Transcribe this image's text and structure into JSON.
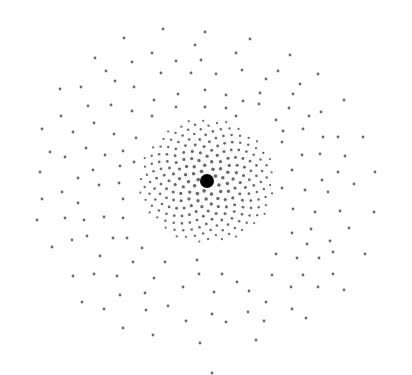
{
  "image": {
    "description": "Hand-drawn radial dot pattern with a large black central dot and gray dots becoming sparser outward",
    "width": 412,
    "height": 375,
    "background": "#ffffff",
    "dot_color": "#6a6a6a",
    "center_color": "#000000",
    "center": {
      "x": 207,
      "y": 181,
      "r": 7
    },
    "outer_dots": [
      [
        163,
        29
      ],
      [
        205,
        32
      ],
      [
        250,
        39
      ],
      [
        124,
        38
      ],
      [
        195,
        45
      ],
      [
        152,
        53
      ],
      [
        236,
        53
      ],
      [
        290,
        55
      ],
      [
        95,
        58
      ],
      [
        132,
        62
      ],
      [
        176,
        61
      ],
      [
        201,
        60
      ],
      [
        318,
        74
      ],
      [
        106,
        71
      ],
      [
        161,
        73
      ],
      [
        191,
        73
      ],
      [
        216,
        74
      ],
      [
        242,
        70
      ],
      [
        278,
        71
      ],
      [
        60,
        89
      ],
      [
        81,
        87
      ],
      [
        134,
        87
      ],
      [
        115,
        81
      ],
      [
        266,
        79
      ],
      [
        300,
        84
      ],
      [
        178,
        94
      ],
      [
        205,
        90
      ],
      [
        226,
        95
      ],
      [
        260,
        93
      ],
      [
        293,
        94
      ],
      [
        344,
        100
      ],
      [
        88,
        106
      ],
      [
        111,
        105
      ],
      [
        154,
        100
      ],
      [
        176,
        107
      ],
      [
        205,
        107
      ],
      [
        226,
        108
      ],
      [
        243,
        101
      ],
      [
        259,
        104
      ],
      [
        289,
        108
      ],
      [
        321,
        112
      ],
      [
        61,
        116
      ],
      [
        94,
        123
      ],
      [
        132,
        111
      ],
      [
        152,
        116
      ],
      [
        236,
        116
      ],
      [
        276,
        120
      ],
      [
        309,
        116
      ],
      [
        42,
        129
      ],
      [
        73,
        132
      ],
      [
        114,
        134
      ],
      [
        136,
        138
      ],
      [
        283,
        131
      ],
      [
        303,
        129
      ],
      [
        323,
        137
      ],
      [
        338,
        137
      ],
      [
        363,
        137
      ],
      [
        50,
        152
      ],
      [
        86,
        148
      ],
      [
        123,
        151
      ],
      [
        65,
        157
      ],
      [
        105,
        155
      ],
      [
        282,
        142
      ],
      [
        302,
        155
      ],
      [
        320,
        154
      ],
      [
        345,
        156
      ],
      [
        40,
        172
      ],
      [
        78,
        178
      ],
      [
        93,
        170
      ],
      [
        120,
        166
      ],
      [
        134,
        162
      ],
      [
        292,
        170
      ],
      [
        322,
        180
      ],
      [
        338,
        172
      ],
      [
        375,
        172
      ],
      [
        62,
        192
      ],
      [
        99,
        185
      ],
      [
        119,
        183
      ],
      [
        282,
        188
      ],
      [
        305,
        190
      ],
      [
        328,
        192
      ],
      [
        354,
        184
      ],
      [
        42,
        199
      ],
      [
        78,
        203
      ],
      [
        123,
        199
      ],
      [
        293,
        209
      ],
      [
        315,
        212
      ],
      [
        340,
        211
      ],
      [
        374,
        212
      ],
      [
        37,
        220
      ],
      [
        65,
        218
      ],
      [
        84,
        220
      ],
      [
        104,
        217
      ],
      [
        123,
        218
      ],
      [
        349,
        228
      ],
      [
        52,
        247
      ],
      [
        72,
        240
      ],
      [
        87,
        236
      ],
      [
        113,
        238
      ],
      [
        127,
        238
      ],
      [
        292,
        233
      ],
      [
        311,
        229
      ],
      [
        330,
        241
      ],
      [
        307,
        244
      ],
      [
        142,
        248
      ],
      [
        165,
        262
      ],
      [
        100,
        256
      ],
      [
        133,
        262
      ],
      [
        197,
        260
      ],
      [
        276,
        254
      ],
      [
        297,
        258
      ],
      [
        333,
        252
      ],
      [
        365,
        254
      ],
      [
        73,
        276
      ],
      [
        94,
        274
      ],
      [
        117,
        276
      ],
      [
        154,
        278
      ],
      [
        199,
        274
      ],
      [
        222,
        274
      ],
      [
        237,
        282
      ],
      [
        272,
        275
      ],
      [
        303,
        275
      ],
      [
        319,
        258
      ],
      [
        333,
        274
      ],
      [
        344,
        290
      ],
      [
        82,
        302
      ],
      [
        120,
        295
      ],
      [
        145,
        293
      ],
      [
        183,
        287
      ],
      [
        214,
        292
      ],
      [
        249,
        291
      ],
      [
        291,
        287
      ],
      [
        318,
        287
      ],
      [
        104,
        309
      ],
      [
        146,
        310
      ],
      [
        168,
        306
      ],
      [
        212,
        314
      ],
      [
        248,
        312
      ],
      [
        266,
        302
      ],
      [
        292,
        309
      ],
      [
        123,
        328
      ],
      [
        153,
        335
      ],
      [
        186,
        321
      ],
      [
        226,
        322
      ],
      [
        264,
        321
      ],
      [
        306,
        318
      ],
      [
        200,
        343
      ],
      [
        256,
        340
      ],
      [
        212,
        373
      ]
    ],
    "inner_cloud": {
      "cx": 207,
      "cy": 181,
      "radius": 68,
      "count": 230,
      "seed": 7
    }
  }
}
